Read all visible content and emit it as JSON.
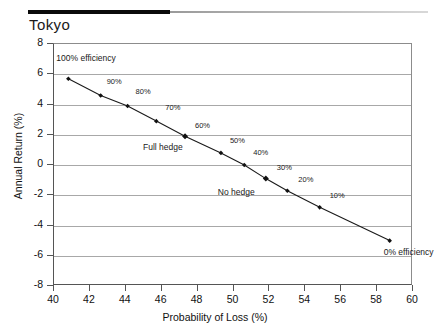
{
  "header": {
    "title": "Tokyo"
  },
  "axes": {
    "x_title": "Probability of Loss (%)",
    "y_title": "Annual Return (%)",
    "x_ticks": [
      "40",
      "42",
      "44",
      "46",
      "48",
      "50",
      "52",
      "54",
      "56",
      "58",
      "60"
    ],
    "y_ticks": [
      "8",
      "6",
      "4",
      "2",
      "0",
      "-2",
      "-4",
      "-6",
      "-8"
    ]
  },
  "colors": {
    "line": "#1a1a1a",
    "marker": "#111111",
    "grid": "#a8a8a8",
    "axis": "#555555",
    "rule": "#0a0a0a"
  },
  "annotations": {
    "full_hedge": "Full hedge",
    "no_hedge": "No hedge"
  },
  "chart_data": {
    "type": "scatter",
    "title": "Tokyo",
    "xlabel": "Probability of Loss (%)",
    "ylabel": "Annual Return (%)",
    "xlim": [
      40,
      60
    ],
    "ylim": [
      -8,
      8
    ],
    "xticks": [
      40,
      42,
      44,
      46,
      48,
      50,
      52,
      54,
      56,
      58,
      60
    ],
    "yticks": [
      8,
      6,
      4,
      2,
      0,
      -2,
      -4,
      -6,
      -8
    ],
    "grid": "horizontal",
    "legend": "none",
    "series": [
      {
        "name": "Hedging efficiency frontier",
        "marker": "diamond",
        "line": "solid",
        "points": [
          {
            "label": "100% efficiency",
            "x": 40.8,
            "y": 5.7
          },
          {
            "label": "90%",
            "x": 42.6,
            "y": 4.6
          },
          {
            "label": "80%",
            "x": 44.1,
            "y": 3.9
          },
          {
            "label": "70%",
            "x": 45.7,
            "y": 2.9
          },
          {
            "label": "60%",
            "x": 47.3,
            "y": 1.9
          },
          {
            "label": "50%",
            "x": 49.3,
            "y": 0.8
          },
          {
            "label": "40%",
            "x": 50.6,
            "y": 0.0
          },
          {
            "label": "30%",
            "x": 51.8,
            "y": -0.9
          },
          {
            "label": "20%",
            "x": 53.0,
            "y": -1.7
          },
          {
            "label": "10%",
            "x": 54.8,
            "y": -2.8
          },
          {
            "label": "0% efficiency",
            "x": 58.7,
            "y": -5.0
          }
        ],
        "annotated_points": [
          {
            "label": "Full hedge",
            "x": 47.3,
            "y": 1.9
          },
          {
            "label": "No hedge",
            "x": 51.8,
            "y": -0.9
          }
        ]
      }
    ]
  }
}
